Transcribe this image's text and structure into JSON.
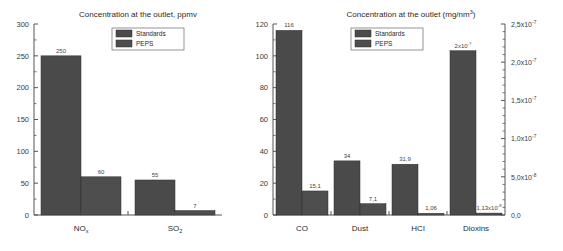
{
  "page": {
    "background": "#ffffff",
    "bar_color_standards": "#4a4a4a",
    "bar_color_peps": "#4e4e4e"
  },
  "chart_data": [
    {
      "id": "left",
      "type": "bar",
      "title": "Concentration at the outlet, ppmv",
      "xlabel": "",
      "ylabel": "",
      "ylim": [
        0,
        300
      ],
      "yticks": [
        0,
        50,
        100,
        150,
        200,
        250,
        300
      ],
      "ytick_labels": [
        "0",
        "50",
        "100",
        "150",
        "200",
        "250",
        "300"
      ],
      "grid": false,
      "legend_position": "top-center",
      "categories": [
        "NO",
        "SO"
      ],
      "category_subscripts": [
        "x",
        "2"
      ],
      "series": [
        {
          "name": "Standards",
          "values": [
            250,
            55
          ],
          "labels": [
            "250",
            "55"
          ]
        },
        {
          "name": "PEPS",
          "values": [
            60,
            7
          ],
          "labels": [
            "60",
            "7"
          ]
        }
      ]
    },
    {
      "id": "right",
      "type": "bar",
      "title": "Concentration at the outlet (mg/nm",
      "title_superscript": "3",
      "title_suffix": ")",
      "xlabel": "",
      "ylabel": "",
      "ylim": [
        0,
        120
      ],
      "yticks": [
        0,
        20,
        40,
        60,
        80,
        100,
        120
      ],
      "ytick_labels": [
        "0",
        "20",
        "40",
        "60",
        "80",
        "100",
        "120"
      ],
      "y2lim": [
        0,
        2.5e-07
      ],
      "y2ticks": [
        0,
        5e-08,
        1e-07,
        1.5e-07,
        2e-07,
        2.5e-07
      ],
      "y2tick_labels": [
        "0,0",
        "5,0x10",
        "1,0x10",
        "1,5x10",
        "2,0x10",
        "2,5x10"
      ],
      "y2tick_exponents": [
        "",
        "-8",
        "-7",
        "-7",
        "-7",
        "-7"
      ],
      "grid": false,
      "legend_position": "top-center",
      "categories": [
        "CO",
        "Dust",
        "HCl",
        "Dioxins"
      ],
      "series": [
        {
          "name": "Standards",
          "values": [
            116,
            34,
            31.9,
            103.2
          ],
          "labels": [
            "116",
            "34",
            "31,9",
            "2x10"
          ],
          "label_exponents": [
            "",
            "",
            "",
            "-7"
          ]
        },
        {
          "name": "PEPS",
          "values": [
            15.1,
            7.1,
            1.06,
            1.2
          ],
          "labels": [
            "15,1",
            "7,1",
            "1,06",
            "1,13x10"
          ],
          "label_exponents": [
            "",
            "",
            "",
            "-8"
          ]
        }
      ]
    }
  ],
  "legend": {
    "entries": [
      "Standards",
      "PEPS"
    ]
  }
}
